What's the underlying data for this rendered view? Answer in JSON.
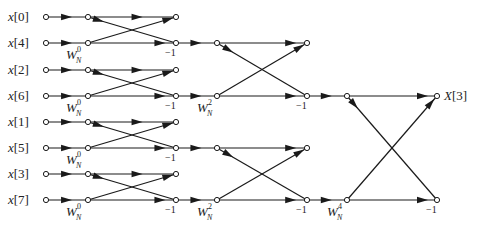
{
  "diagram": {
    "inputs": [
      {
        "label": "x[0]",
        "y": 17
      },
      {
        "label": "x[4]",
        "y": 43
      },
      {
        "label": "x[2]",
        "y": 70
      },
      {
        "label": "x[6]",
        "y": 96
      },
      {
        "label": "x[1]",
        "y": 122
      },
      {
        "label": "x[5]",
        "y": 148
      },
      {
        "label": "x[3]",
        "y": 174
      },
      {
        "label": "x[7]",
        "y": 200
      }
    ],
    "output": {
      "label": "X[3]",
      "y": 96
    },
    "twiddles": {
      "stage1": "W_N^0",
      "stage2": "W_N^2",
      "stage3": "W_N^4"
    },
    "twiddle_base": "W",
    "twiddle_sub": "N",
    "twiddle_exps": {
      "stage1": "0",
      "stage2": "2",
      "stage3": "4"
    },
    "minus_one_label": "−1",
    "colors": {
      "line": "#1a1a1a",
      "background": "#ffffff"
    }
  }
}
